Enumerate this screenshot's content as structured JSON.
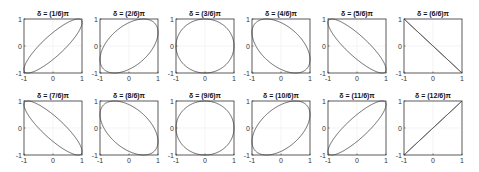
{
  "chart_data": {
    "type": "line",
    "title": "",
    "layout": {
      "rows": 2,
      "cols": 6
    },
    "xlim": [
      -1,
      1
    ],
    "ylim": [
      -1,
      1
    ],
    "xticks": [
      "-1",
      "0",
      "1"
    ],
    "yticks": [
      "-1",
      "0",
      "1"
    ],
    "grid": true,
    "line_color": "#555555",
    "panels": [
      {
        "title": "δ = (1/6)π",
        "delta_over_pi": 0.1667
      },
      {
        "title": "δ = (2/6)π",
        "delta_over_pi": 0.3333
      },
      {
        "title": "δ = (3/6)π",
        "delta_over_pi": 0.5
      },
      {
        "title": "δ = (4/6)π",
        "delta_over_pi": 0.6667
      },
      {
        "title": "δ = (5/6)π",
        "delta_over_pi": 0.8333
      },
      {
        "title": "δ = (6/6)π",
        "delta_over_pi": 1.0
      },
      {
        "title": "δ = (7/6)π",
        "delta_over_pi": 1.1667
      },
      {
        "title": "δ = (8/6)π",
        "delta_over_pi": 1.3333
      },
      {
        "title": "δ = (9/6)π",
        "delta_over_pi": 1.5
      },
      {
        "title": "δ = (10/6)π",
        "delta_over_pi": 1.6667
      },
      {
        "title": "δ = (11/6)π",
        "delta_over_pi": 1.8333
      },
      {
        "title": "δ = (12/6)π",
        "delta_over_pi": 2.0
      }
    ]
  }
}
